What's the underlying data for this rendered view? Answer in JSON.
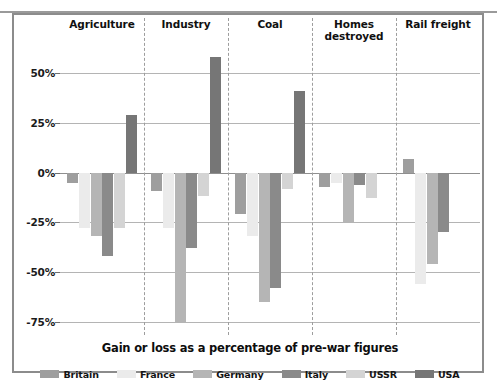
{
  "caption": "Gain or loss as a percentage of pre-war figures",
  "legend": {
    "items": [
      {
        "label": "Britain",
        "color": "#9e9e9e"
      },
      {
        "label": "France",
        "color": "#ebebeb"
      },
      {
        "label": "Germany",
        "color": "#b5b5b5"
      },
      {
        "label": "Italy",
        "color": "#8a8a8a"
      },
      {
        "label": "USSR",
        "color": "#d4d4d4"
      },
      {
        "label": "USA",
        "color": "#767676"
      }
    ]
  },
  "axis": {
    "ticks": [
      "50%",
      "25%",
      "0%",
      "-25%",
      "-50%",
      "-75%"
    ],
    "tick_values": [
      50,
      25,
      0,
      -25,
      -50,
      -75
    ]
  },
  "chart_data": {
    "type": "bar",
    "title": "Gain or loss as a percentage of pre-war figures",
    "xlabel": "",
    "ylabel": "",
    "ylim": [
      -80,
      65
    ],
    "grid": true,
    "legend_position": "bottom",
    "categories": [
      "Agriculture",
      "Industry",
      "Coal",
      "Homes destroyed",
      "Rail freight"
    ],
    "series": [
      {
        "name": "Britain",
        "color": "#9e9e9e",
        "values": [
          -5,
          -9,
          -21,
          -7,
          7
        ]
      },
      {
        "name": "France",
        "color": "#ebebeb",
        "values": [
          -28,
          -28,
          -32,
          -5,
          -56
        ]
      },
      {
        "name": "Germany",
        "color": "#b5b5b5",
        "values": [
          -32,
          -75,
          -65,
          -25,
          -46
        ]
      },
      {
        "name": "Italy",
        "color": "#8a8a8a",
        "values": [
          -42,
          -38,
          -58,
          -6,
          -30
        ]
      },
      {
        "name": "USSR",
        "color": "#d4d4d4",
        "values": [
          -28,
          -12,
          -8,
          -13,
          0
        ]
      },
      {
        "name": "USA",
        "color": "#767676",
        "values": [
          29,
          58,
          41,
          0,
          0
        ]
      }
    ]
  }
}
